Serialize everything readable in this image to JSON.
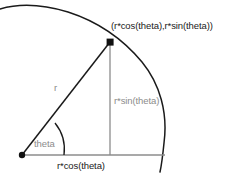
{
  "diagram": {
    "colors": {
      "stroke_dark": "#1a1a1a",
      "stroke_gray": "#8c8c8c",
      "background": "#ffffff",
      "text_dark": "#1a1a1a",
      "text_gray": "#8c8c8c"
    },
    "labels": {
      "point": "(r*cos(theta),r*sin(theta))",
      "radius": "r",
      "angle": "theta",
      "opposite": "r*sin(theta)",
      "adjacent": "r*cos(theta)"
    },
    "geometry": {
      "origin": {
        "x": 22,
        "y": 155
      },
      "point": {
        "x": 110,
        "y": 42
      },
      "axis_end": {
        "x": 165,
        "y": 155
      },
      "circle_radius": 143,
      "angle_arc_radius": 42
    }
  }
}
